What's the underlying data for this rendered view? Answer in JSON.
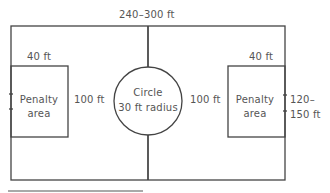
{
  "diagram": {
    "type": "soccer-field-dimensions",
    "colors": {
      "line": "#444444",
      "text": "#555555",
      "background": "#ffffff"
    },
    "labels": {
      "field_length": "240–300 ft",
      "left_penalty_width": "40 ft",
      "right_penalty_width": "40 ft",
      "left_penalty_name_1": "Penalty",
      "left_penalty_name_2": "area",
      "right_penalty_name_1": "Penalty",
      "right_penalty_name_2": "area",
      "left_penalty_height": "100 ft",
      "right_penalty_height": "100 ft",
      "circle_name": "Circle",
      "circle_radius": "30 ft radius",
      "field_width_1": "120–",
      "field_width_2": "150 ft"
    }
  }
}
